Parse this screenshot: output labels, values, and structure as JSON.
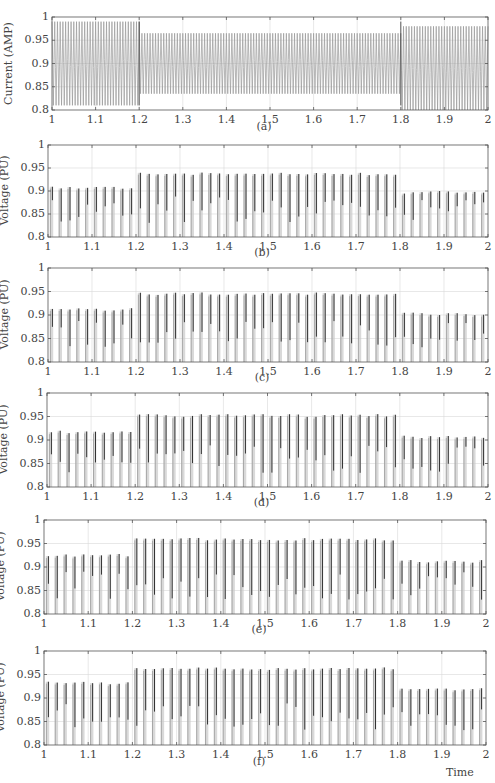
{
  "figure": {
    "x_axis_label": "Time",
    "x_ticks": [
      "1",
      "1.1",
      "1.2",
      "1.3",
      "1.4",
      "1.5",
      "1.6",
      "1.7",
      "1.8",
      "1.9",
      "2"
    ],
    "y_ticks": [
      "1",
      "0.95",
      "0.9",
      "0.85",
      "0.8"
    ]
  },
  "chart_data": [
    {
      "type": "line",
      "panel": "(a)",
      "ylabel": "Current (AMP)",
      "xlabel": "",
      "xlim": [
        1,
        2
      ],
      "ylim": [
        0.8,
        1.0
      ],
      "grid": true,
      "signal": "dense oscillating current waveform with step changes at t=1.2 and t=1.8",
      "segments": [
        {
          "t_start": 1.0,
          "t_end": 1.2,
          "min": 0.81,
          "max": 0.99
        },
        {
          "t_start": 1.2,
          "t_end": 1.8,
          "min": 0.835,
          "max": 0.965
        },
        {
          "t_start": 1.8,
          "t_end": 2.0,
          "min": 0.8,
          "max": 0.98
        }
      ]
    },
    {
      "type": "line",
      "panel": "(b)",
      "ylabel": "Voltage (PU)",
      "xlabel": "",
      "xlim": [
        1,
        2
      ],
      "ylim": [
        0.8,
        1.0
      ],
      "grid": true,
      "signal": "voltage pulses with peak envelope stepping up at t=1.2 and down at t=1.8",
      "segments": [
        {
          "t_start": 1.0,
          "t_end": 1.2,
          "min": 0.8,
          "peak": 0.91
        },
        {
          "t_start": 1.2,
          "t_end": 1.8,
          "min": 0.8,
          "peak": 0.94
        },
        {
          "t_start": 1.8,
          "t_end": 2.0,
          "min": 0.8,
          "peak": 0.9
        }
      ]
    },
    {
      "type": "line",
      "panel": "(c)",
      "ylabel": "Voltage (PU)",
      "xlabel": "",
      "xlim": [
        1,
        2
      ],
      "ylim": [
        0.8,
        1.0
      ],
      "grid": true,
      "segments": [
        {
          "t_start": 1.0,
          "t_end": 1.2,
          "min": 0.8,
          "peak": 0.915
        },
        {
          "t_start": 1.2,
          "t_end": 1.8,
          "min": 0.8,
          "peak": 0.948
        },
        {
          "t_start": 1.8,
          "t_end": 2.0,
          "min": 0.8,
          "peak": 0.905
        }
      ]
    },
    {
      "type": "line",
      "panel": "(d)",
      "ylabel": "Voltage (PU)",
      "xlabel": "",
      "xlim": [
        1,
        2
      ],
      "ylim": [
        0.8,
        1.0
      ],
      "grid": true,
      "segments": [
        {
          "t_start": 1.0,
          "t_end": 1.2,
          "min": 0.8,
          "peak": 0.92
        },
        {
          "t_start": 1.2,
          "t_end": 1.8,
          "min": 0.8,
          "peak": 0.955
        },
        {
          "t_start": 1.8,
          "t_end": 2.0,
          "min": 0.8,
          "peak": 0.91
        }
      ]
    },
    {
      "type": "line",
      "panel": "(e)",
      "ylabel": "Voltage (PU)",
      "xlabel": "",
      "xlim": [
        1,
        2
      ],
      "ylim": [
        0.8,
        1.0
      ],
      "grid": true,
      "segments": [
        {
          "t_start": 1.0,
          "t_end": 1.2,
          "min": 0.8,
          "peak": 0.928
        },
        {
          "t_start": 1.2,
          "t_end": 1.8,
          "min": 0.8,
          "peak": 0.962
        },
        {
          "t_start": 1.8,
          "t_end": 2.0,
          "min": 0.8,
          "peak": 0.915
        }
      ]
    },
    {
      "type": "line",
      "panel": "(f)",
      "ylabel": "Voltage (PU)",
      "xlabel": "Time",
      "xlim": [
        1,
        2
      ],
      "ylim": [
        0.8,
        1.0
      ],
      "grid": true,
      "segments": [
        {
          "t_start": 1.0,
          "t_end": 1.2,
          "min": 0.8,
          "peak": 0.935
        },
        {
          "t_start": 1.2,
          "t_end": 1.8,
          "min": 0.8,
          "peak": 0.965
        },
        {
          "t_start": 1.8,
          "t_end": 2.0,
          "min": 0.8,
          "peak": 0.922
        }
      ]
    }
  ],
  "panels": [
    {
      "caption": "(a)",
      "ylabel": "Current (AMP)",
      "box": {
        "left": 52,
        "top": 17,
        "width": 436,
        "height": 93
      },
      "caption_y": 120
    },
    {
      "caption": "(b)",
      "ylabel": "Voltage (PU)",
      "box": {
        "left": 48,
        "top": 145,
        "width": 440,
        "height": 92
      },
      "caption_y": 246
    },
    {
      "caption": "(c)",
      "ylabel": "Voltage (PU)",
      "box": {
        "left": 48,
        "top": 268,
        "width": 440,
        "height": 94
      },
      "caption_y": 371
    },
    {
      "caption": "(d)",
      "ylabel": "Voltage (PU)",
      "box": {
        "left": 47,
        "top": 393,
        "width": 441,
        "height": 94
      },
      "caption_y": 496
    },
    {
      "caption": "(e)",
      "ylabel": "Voltage (PU)",
      "box": {
        "left": 44,
        "top": 520,
        "width": 442,
        "height": 94
      },
      "caption_y": 623
    },
    {
      "caption": "(f)",
      "ylabel": "Voltage (PU)",
      "box": {
        "left": 44,
        "top": 651,
        "width": 442,
        "height": 94
      },
      "caption_y": 755
    }
  ],
  "colors": {
    "axis": "#555555",
    "grid": "#d8d8d8",
    "trace_dark": "#333333",
    "trace_light": "#9a9a9a"
  }
}
